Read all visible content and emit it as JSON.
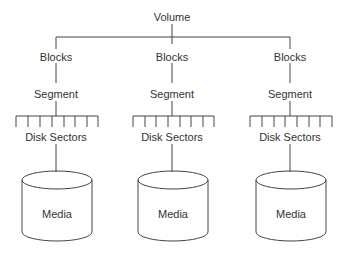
{
  "diagram": {
    "root": "Volume",
    "columns": [
      {
        "blocks": "Blocks",
        "segment": "Segment",
        "sectors": "Disk Sectors",
        "media": "Media"
      },
      {
        "blocks": "Blocks",
        "segment": "Segment",
        "sectors": "Disk Sectors",
        "media": "Media"
      },
      {
        "blocks": "Blocks",
        "segment": "Segment",
        "sectors": "Disk Sectors",
        "media": "Media"
      }
    ]
  },
  "colors": {
    "line": "#444444",
    "text": "#333333",
    "background": "#ffffff"
  }
}
